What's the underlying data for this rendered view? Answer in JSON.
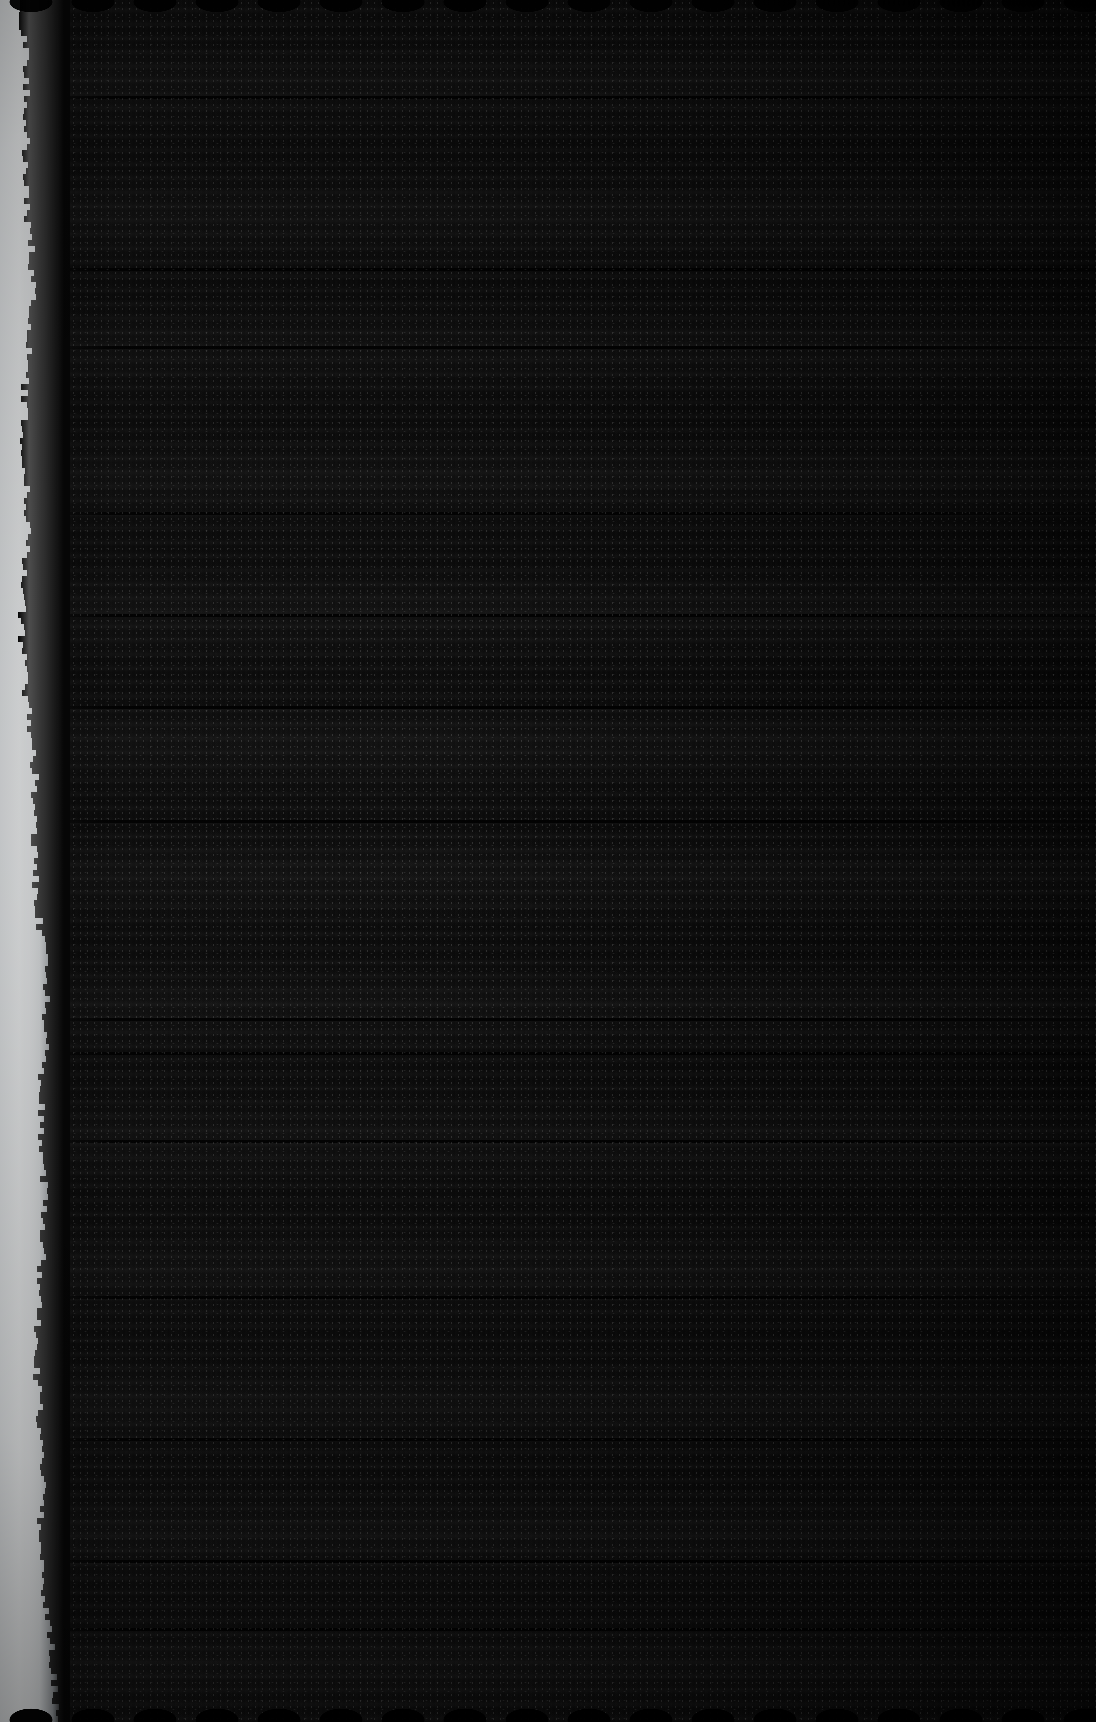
{
  "image": {
    "domain": "Natural-Image",
    "subject": "extreme close-up photograph of dark woven textile with a frayed white edge",
    "width_px": 1096,
    "height_px": 1722,
    "visible_text": "",
    "orientation": "portrait"
  },
  "colors": {
    "fabric_black": "#0a0a0a",
    "fabric_deep_black": "#020202",
    "frayed_edge_white": "#f2f4f6",
    "frayed_edge_grey": "#9aa0a4",
    "background_black": "#000000"
  },
  "regions": {
    "frayed_edge": {
      "name": "white frayed left edge",
      "position": "left",
      "approx_width_px": 40,
      "description": "bright white fibrous torn selvage running the full height, narrow at top, widening toward the bottom"
    },
    "fabric_field": {
      "name": "dark woven fabric field",
      "position": "center-right",
      "description": "near-black textile filling the frame with horizontal weave banding and fine vertical warp threads"
    },
    "top_edge": {
      "name": "scalloped top cut edge",
      "description": "subtle wavy scalloped cut along the top of the fabric"
    },
    "bottom_edge": {
      "name": "scalloped bottom cut edge",
      "description": "pronounced wavy scalloped cut along the bottom of the fabric"
    }
  },
  "texture": {
    "weave_band_spacing_px": 14,
    "tonal_stripe_spacing_px": 132,
    "scallop_wavelength_px": 62,
    "grain": "fine film grain / speckle throughout"
  }
}
